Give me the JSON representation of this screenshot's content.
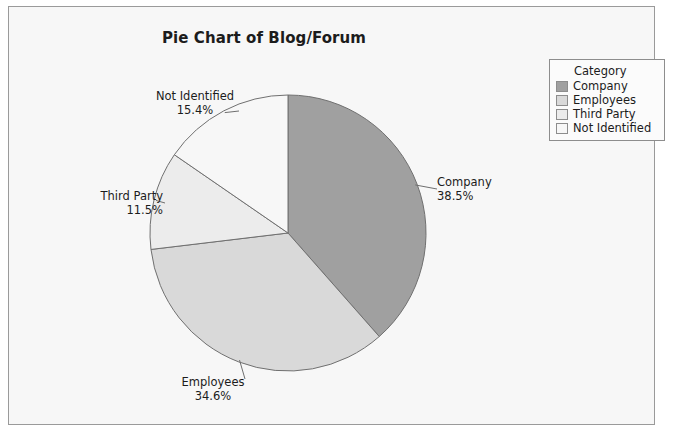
{
  "chart": {
    "title": "Pie Chart of Blog/Forum",
    "frame_border_color": "#9a9a9a",
    "background_color": "#f7f7f7"
  },
  "legend": {
    "title": "Category",
    "items": [
      {
        "label": "Company",
        "color": "#a0a0a0"
      },
      {
        "label": "Employees",
        "color": "#d9d9d9"
      },
      {
        "label": "Third Party",
        "color": "#ececec"
      },
      {
        "label": "Not Identified",
        "color": "#f7f7f7"
      }
    ]
  },
  "labels": {
    "company": {
      "name": "Company",
      "pct": "38.5%"
    },
    "employees": {
      "name": "Employees",
      "pct": "34.6%"
    },
    "thirdparty": {
      "name": "Third Party",
      "pct": "11.5%"
    },
    "notident": {
      "name": "Not Identified",
      "pct": "15.4%"
    }
  },
  "chart_data": {
    "type": "pie",
    "title": "Pie Chart of Blog/Forum",
    "legend_title": "Category",
    "legend_position": "top-right",
    "start_angle_deg": 90,
    "direction": "clockwise",
    "categories": [
      "Company",
      "Employees",
      "Third Party",
      "Not Identified"
    ],
    "values": [
      38.5,
      34.6,
      11.5,
      15.4
    ],
    "value_unit": "percent",
    "labels": [
      "38.5%",
      "34.6%",
      "11.5%",
      "15.4%"
    ],
    "colors": [
      "#a0a0a0",
      "#d9d9d9",
      "#ececec",
      "#f7f7f7"
    ],
    "slice_border_color": "#707070",
    "total": 100.0
  }
}
